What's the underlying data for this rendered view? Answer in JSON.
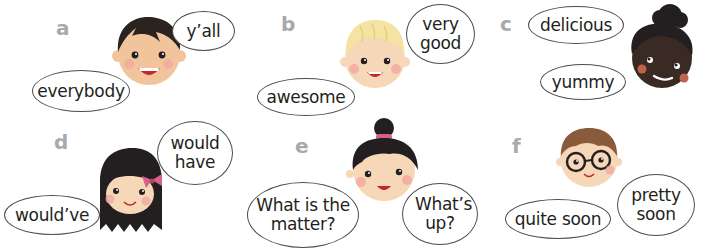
{
  "panels": [
    {
      "letter": "a",
      "bubbles": [
        {
          "text": "y’all"
        },
        {
          "text": "everybody"
        }
      ],
      "face": "boy-dark-hair"
    },
    {
      "letter": "b",
      "bubbles": [
        {
          "text": "very good"
        },
        {
          "text": "awesome"
        }
      ],
      "face": "boy-blond-hair"
    },
    {
      "letter": "c",
      "bubbles": [
        {
          "text": "delicious"
        },
        {
          "text": "yummy"
        }
      ],
      "face": "girl-curly-hair"
    },
    {
      "letter": "d",
      "bubbles": [
        {
          "text": "would have"
        },
        {
          "text": "would’ve"
        }
      ],
      "face": "girl-long-hair-bow"
    },
    {
      "letter": "e",
      "bubbles": [
        {
          "text": "What is the matter?"
        },
        {
          "text": "What’s up?"
        }
      ],
      "face": "girl-hair-bun"
    },
    {
      "letter": "f",
      "bubbles": [
        {
          "text": "pretty soon"
        },
        {
          "text": "quite soon"
        }
      ],
      "face": "boy-glasses"
    }
  ],
  "colors": {
    "label": "#a7a9ac",
    "outline": "#4d4d4d",
    "skin_light": "#f6d7b8",
    "skin_dark": "#3a2a24",
    "cheek": "#f2a9a0",
    "hair_dark": "#231f20",
    "hair_blond": "#f4e3a1",
    "hair_brown": "#8a5a3c",
    "mouth": "#c1272d",
    "bow": "#d6608a"
  }
}
